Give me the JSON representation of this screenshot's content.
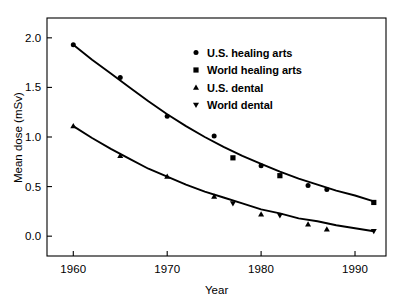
{
  "chart_data": {
    "type": "scatter",
    "title": "",
    "xlabel": "Year",
    "ylabel": "Mean dose (mSv)",
    "xlim": [
      1957.2,
      1993.3
    ],
    "ylim": [
      -0.2,
      2.2
    ],
    "xticks": [
      1960,
      1970,
      1980,
      1990
    ],
    "xtick_labels": [
      "1960",
      "1970",
      "1980",
      "1990"
    ],
    "yticks": [
      0.0,
      0.5,
      1.0,
      1.5,
      2.0
    ],
    "ytick_labels": [
      "0.0",
      "0.5",
      "1.0",
      "1.5",
      "2.0"
    ],
    "grid": false,
    "legend_position": "upper center",
    "series": [
      {
        "name": "U.S. healing arts",
        "marker": "circle",
        "color": "#000000",
        "points": [
          {
            "x": 1960,
            "y": 1.93
          },
          {
            "x": 1965,
            "y": 1.6
          },
          {
            "x": 1970,
            "y": 1.21
          },
          {
            "x": 1975,
            "y": 1.01
          },
          {
            "x": 1980,
            "y": 0.71
          },
          {
            "x": 1985,
            "y": 0.51
          },
          {
            "x": 1987,
            "y": 0.47
          }
        ]
      },
      {
        "name": "World healing arts",
        "marker": "square",
        "color": "#000000",
        "points": [
          {
            "x": 1977,
            "y": 0.79
          },
          {
            "x": 1982,
            "y": 0.61
          },
          {
            "x": 1992,
            "y": 0.34
          }
        ]
      },
      {
        "name": "U.S. dental",
        "marker": "triangle-up",
        "color": "#000000",
        "points": [
          {
            "x": 1960,
            "y": 1.11
          },
          {
            "x": 1965,
            "y": 0.81
          },
          {
            "x": 1970,
            "y": 0.6
          },
          {
            "x": 1975,
            "y": 0.4
          },
          {
            "x": 1980,
            "y": 0.22
          },
          {
            "x": 1985,
            "y": 0.12
          },
          {
            "x": 1987,
            "y": 0.07
          }
        ]
      },
      {
        "name": "World dental",
        "marker": "triangle-down",
        "color": "#000000",
        "points": [
          {
            "x": 1977,
            "y": 0.33
          },
          {
            "x": 1982,
            "y": 0.21
          },
          {
            "x": 1992,
            "y": 0.05
          }
        ]
      }
    ],
    "fit_curves": [
      {
        "name": "healing arts fit",
        "comment": "smooth decaying trend through healing-arts points",
        "points": [
          {
            "x": 1960,
            "y": 1.93
          },
          {
            "x": 1962,
            "y": 1.78
          },
          {
            "x": 1964,
            "y": 1.64
          },
          {
            "x": 1966,
            "y": 1.5
          },
          {
            "x": 1968,
            "y": 1.36
          },
          {
            "x": 1970,
            "y": 1.23
          },
          {
            "x": 1972,
            "y": 1.11
          },
          {
            "x": 1974,
            "y": 1.0
          },
          {
            "x": 1976,
            "y": 0.9
          },
          {
            "x": 1978,
            "y": 0.81
          },
          {
            "x": 1980,
            "y": 0.73
          },
          {
            "x": 1982,
            "y": 0.65
          },
          {
            "x": 1984,
            "y": 0.58
          },
          {
            "x": 1986,
            "y": 0.52
          },
          {
            "x": 1988,
            "y": 0.46
          },
          {
            "x": 1990,
            "y": 0.41
          },
          {
            "x": 1992,
            "y": 0.35
          }
        ]
      },
      {
        "name": "dental fit",
        "comment": "smooth decaying trend through dental points",
        "points": [
          {
            "x": 1960,
            "y": 1.11
          },
          {
            "x": 1962,
            "y": 0.99
          },
          {
            "x": 1964,
            "y": 0.88
          },
          {
            "x": 1966,
            "y": 0.78
          },
          {
            "x": 1968,
            "y": 0.68
          },
          {
            "x": 1970,
            "y": 0.6
          },
          {
            "x": 1972,
            "y": 0.52
          },
          {
            "x": 1974,
            "y": 0.45
          },
          {
            "x": 1976,
            "y": 0.39
          },
          {
            "x": 1978,
            "y": 0.33
          },
          {
            "x": 1980,
            "y": 0.27
          },
          {
            "x": 1982,
            "y": 0.23
          },
          {
            "x": 1984,
            "y": 0.18
          },
          {
            "x": 1986,
            "y": 0.15
          },
          {
            "x": 1988,
            "y": 0.11
          },
          {
            "x": 1990,
            "y": 0.08
          },
          {
            "x": 1992,
            "y": 0.05
          }
        ]
      }
    ]
  },
  "axes": {
    "x_title": "Year",
    "y_title": "Mean dose (mSv)",
    "frame_color": "#000000"
  },
  "legend": {
    "entries": [
      {
        "label": "U.S. healing arts",
        "marker": "circle"
      },
      {
        "label": "World healing arts",
        "marker": "square"
      },
      {
        "label": "U.S. dental",
        "marker": "triangle-up"
      },
      {
        "label": "World dental",
        "marker": "triangle-down"
      }
    ]
  }
}
